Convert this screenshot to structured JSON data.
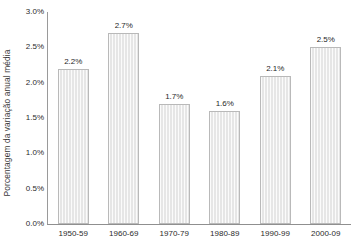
{
  "chart_data": {
    "type": "bar",
    "title": "",
    "xlabel": "",
    "ylabel": "Porcentagem da variação anual média",
    "categories": [
      "1950-59",
      "1960-69",
      "1970-79",
      "1980-89",
      "1990-99",
      "2000-09"
    ],
    "values": [
      2.2,
      2.7,
      1.7,
      1.6,
      2.1,
      2.5
    ],
    "value_labels": [
      "2.2%",
      "2.7%",
      "1.7%",
      "1.6%",
      "2.1%",
      "2.5%"
    ],
    "ylim": [
      0.0,
      3.0
    ],
    "ytick_values": [
      0.0,
      0.5,
      1.0,
      1.5,
      2.0,
      2.5,
      3.0
    ],
    "ytick_labels": [
      "0.0%",
      "0.5%",
      "1.0%",
      "1.5%",
      "2.0%",
      "2.5%",
      "3.0%"
    ],
    "grid": false,
    "legend": "none",
    "series_name": "Variação anual média",
    "bar_fill_color": "#e6e6e6",
    "bar_border_color": "#b9b9b9",
    "axis_color": "#8f8f8f",
    "text_color": "#2b2b2b"
  }
}
